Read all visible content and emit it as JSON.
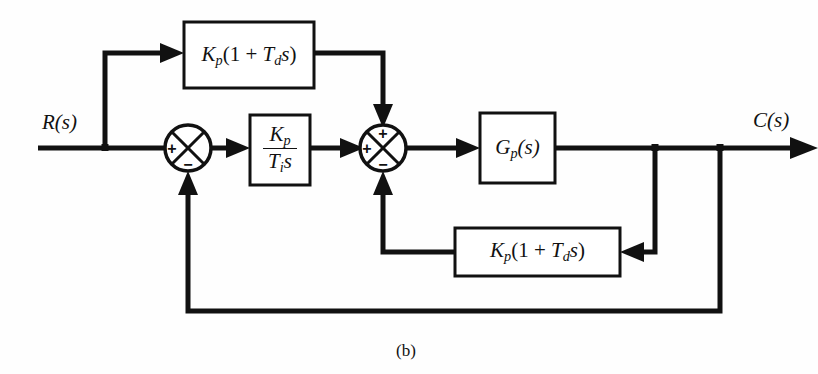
{
  "figure": {
    "caption": "(b)",
    "type": "control-system-block-diagram"
  },
  "signals": {
    "input_label": "R(s)",
    "output_label": "C(s)"
  },
  "blocks": {
    "feedforward_derivative": {
      "gain": "K",
      "gain_sub": "p",
      "open_paren": "(1 + ",
      "term": "T",
      "term_sub": "d",
      "var": "s",
      "close_paren": ")"
    },
    "integral": {
      "numerator_gain": "K",
      "numerator_sub": "p",
      "denominator_gain": "T",
      "denominator_sub": "i",
      "denominator_var": "s"
    },
    "plant": {
      "gain": "G",
      "gain_sub": "p",
      "arg": "(s)"
    },
    "feedback_derivative": {
      "gain": "K",
      "gain_sub": "p",
      "open_paren": "(1 + ",
      "term": "T",
      "term_sub": "d",
      "var": "s",
      "close_paren": ")"
    }
  },
  "summing_junctions": {
    "first": {
      "left_sign": "+",
      "bottom_sign": "−"
    },
    "second": {
      "top_sign": "+",
      "left_sign": "+",
      "bottom_sign": "−"
    }
  },
  "colors": {
    "line": "#111111",
    "background": "#fefefe",
    "block_fill": "#ffffff"
  }
}
